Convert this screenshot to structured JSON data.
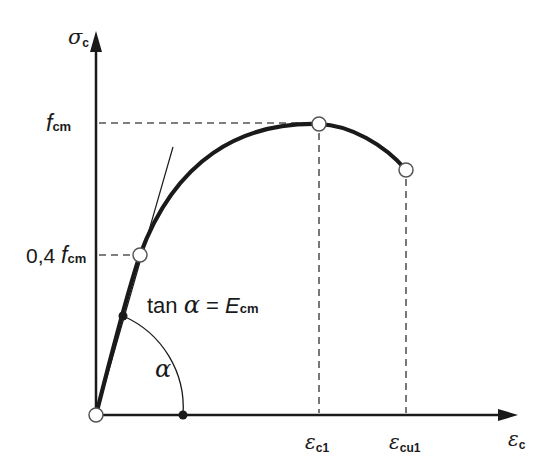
{
  "diagram": {
    "axes": {
      "y_label": {
        "main": "σ",
        "sub": "c"
      },
      "x_label": {
        "main": "ε",
        "sub": "c"
      }
    },
    "y_ticks": [
      {
        "main": "f",
        "sub": "cm",
        "prefix": ""
      },
      {
        "main": "f",
        "sub": "cm",
        "prefix": "0,4 "
      }
    ],
    "x_ticks": [
      {
        "main": "ε",
        "sub": "c1"
      },
      {
        "main": "ε",
        "sub": "cu1"
      }
    ],
    "annotations": {
      "tangent_prefix": "tan ",
      "alpha": "α",
      "equals": " = ",
      "modulus_main": "E",
      "modulus_sub": "cm",
      "angle_label": "α"
    },
    "colors": {
      "curve": "#1a1a1a",
      "dashed": "#555555",
      "marker_fill": "#ffffff"
    }
  }
}
